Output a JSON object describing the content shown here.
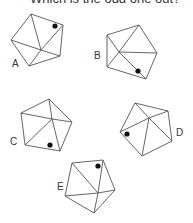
{
  "question": "Which is the odd one out?",
  "options": [
    {
      "label": "A",
      "label_pos": [
        12,
        67
      ],
      "vertices": [
        [
          31,
          14
        ],
        [
          63,
          25
        ],
        [
          60,
          56
        ],
        [
          29,
          66
        ],
        [
          11,
          40
        ]
      ],
      "center": [
        41,
        50
      ],
      "spokes": [
        [
          31,
          14
        ],
        [
          63,
          25
        ],
        [
          60,
          56
        ],
        [
          29,
          66
        ],
        [
          11,
          40
        ]
      ],
      "dot": [
        55,
        26
      ]
    },
    {
      "label": "B",
      "label_pos": [
        94,
        59
      ],
      "vertices": [
        [
          107,
          35
        ],
        [
          139,
          25
        ],
        [
          157,
          53
        ],
        [
          146,
          79
        ],
        [
          107,
          67
        ]
      ],
      "center": [
        119,
        52
      ],
      "spokes": [
        [
          107,
          35
        ],
        [
          139,
          25
        ],
        [
          157,
          53
        ],
        [
          146,
          79
        ],
        [
          107,
          67
        ]
      ],
      "dot": [
        138,
        71
      ]
    },
    {
      "label": "C",
      "label_pos": [
        10,
        145
      ],
      "vertices": [
        [
          49,
          99
        ],
        [
          72,
          122
        ],
        [
          60,
          151
        ],
        [
          25,
          145
        ],
        [
          21,
          113
        ]
      ],
      "center": [
        52,
        119
      ],
      "spokes": [
        [
          49,
          99
        ],
        [
          72,
          122
        ],
        [
          60,
          151
        ],
        [
          25,
          145
        ],
        [
          21,
          113
        ]
      ],
      "dot": [
        50,
        145
      ]
    },
    {
      "label": "D",
      "label_pos": [
        176,
        136
      ],
      "vertices": [
        [
          135,
          103
        ],
        [
          168,
          111
        ],
        [
          172,
          141
        ],
        [
          142,
          156
        ],
        [
          120,
          132
        ]
      ],
      "center": [
        149,
        118
      ],
      "spokes": [
        [
          135,
          103
        ],
        [
          168,
          111
        ],
        [
          172,
          141
        ],
        [
          142,
          156
        ],
        [
          120,
          132
        ]
      ],
      "dot": [
        127,
        134
      ]
    },
    {
      "label": "E",
      "label_pos": [
        57,
        190
      ],
      "vertices": [
        [
          72,
          163
        ],
        [
          103,
          160
        ],
        [
          115,
          190
        ],
        [
          94,
          213
        ],
        [
          65,
          196
        ]
      ],
      "center": [
        98,
        193
      ],
      "spokes": [
        [
          72,
          163
        ],
        [
          103,
          160
        ],
        [
          115,
          190
        ],
        [
          94,
          213
        ],
        [
          65,
          196
        ]
      ],
      "dot": [
        98,
        166
      ]
    }
  ],
  "colors": {
    "stroke": "#555555",
    "dot": "#111111",
    "background": "#ffffff"
  }
}
